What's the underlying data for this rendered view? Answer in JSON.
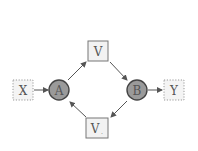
{
  "nodes": {
    "x": {
      "label": "X",
      "shape": "dotted-square"
    },
    "a": {
      "label": "A",
      "shape": "circle"
    },
    "v_top": {
      "label": "V",
      "shape": "square"
    },
    "b": {
      "label": "B",
      "shape": "circle"
    },
    "y": {
      "label": "Y",
      "shape": "dotted-square"
    },
    "v_bottom": {
      "label": "V",
      "subscript": ".",
      "shape": "square"
    }
  },
  "edges": [
    {
      "from": "X",
      "to": "A"
    },
    {
      "from": "A",
      "to": "V"
    },
    {
      "from": "V",
      "to": "B"
    },
    {
      "from": "B",
      "to": "Y"
    },
    {
      "from": "B",
      "to": "V."
    },
    {
      "from": "V.",
      "to": "A"
    }
  ],
  "colors": {
    "circle_fill": "#9a9a9a",
    "circle_stroke": "#444444",
    "box_fill": "#f2f2f2",
    "box_stroke": "#777777",
    "dotted_stroke": "#999999",
    "arrow": "#555555"
  }
}
